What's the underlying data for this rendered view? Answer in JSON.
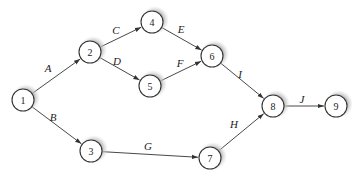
{
  "diagram": {
    "type": "activity-network",
    "colors": {
      "line": "#333333",
      "node_fill": "#ffffff",
      "shadow": "#bdbdbd"
    },
    "nodes": [
      {
        "id": "1",
        "label": "1",
        "x": 23,
        "y": 100
      },
      {
        "id": "2",
        "label": "2",
        "x": 90,
        "y": 52
      },
      {
        "id": "3",
        "label": "3",
        "x": 91,
        "y": 151
      },
      {
        "id": "4",
        "label": "4",
        "x": 152,
        "y": 22
      },
      {
        "id": "5",
        "label": "5",
        "x": 150,
        "y": 86
      },
      {
        "id": "6",
        "label": "6",
        "x": 212,
        "y": 56
      },
      {
        "id": "7",
        "label": "7",
        "x": 210,
        "y": 158
      },
      {
        "id": "8",
        "label": "8",
        "x": 273,
        "y": 106
      },
      {
        "id": "9",
        "label": "9",
        "x": 336,
        "y": 106
      }
    ],
    "edges": [
      {
        "from": "1",
        "to": "2",
        "label": "A",
        "lx": 48,
        "ly": 72
      },
      {
        "from": "1",
        "to": "3",
        "label": "B",
        "lx": 53,
        "ly": 121
      },
      {
        "from": "2",
        "to": "4",
        "label": "C",
        "lx": 116,
        "ly": 34
      },
      {
        "from": "2",
        "to": "5",
        "label": "D",
        "lx": 117,
        "ly": 65
      },
      {
        "from": "4",
        "to": "6",
        "label": "E",
        "lx": 181,
        "ly": 33
      },
      {
        "from": "5",
        "to": "6",
        "label": "F",
        "lx": 180,
        "ly": 67
      },
      {
        "from": "3",
        "to": "7",
        "label": "G",
        "lx": 148,
        "ly": 150
      },
      {
        "from": "7",
        "to": "8",
        "label": "H",
        "lx": 234,
        "ly": 128
      },
      {
        "from": "6",
        "to": "8",
        "label": "I",
        "lx": 240,
        "ly": 78
      },
      {
        "from": "8",
        "to": "9",
        "label": "J",
        "lx": 302,
        "ly": 103
      }
    ]
  }
}
